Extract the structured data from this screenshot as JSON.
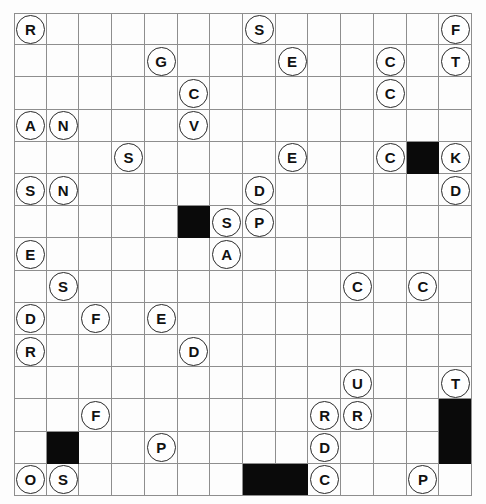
{
  "puzzle": {
    "title": "Letter Circle Grid Puzzle",
    "type": "grid-puzzle",
    "grid": {
      "columns": 14,
      "rows": 15,
      "cell_size": 32.7
    },
    "colors": {
      "grid_line": "#8e8e8e",
      "blocked_cell": "#0a0a0a",
      "token_fill": "#ffffff",
      "token_border": "#2a2a2a",
      "background": "#ffffff"
    },
    "blocked_cells": [
      {
        "col": 12,
        "row": 4
      },
      {
        "col": 5,
        "row": 6
      },
      {
        "col": 13,
        "row": 12
      },
      {
        "col": 13,
        "row": 13
      },
      {
        "col": 1,
        "row": 13
      },
      {
        "col": 7,
        "row": 14
      },
      {
        "col": 8,
        "row": 14
      }
    ],
    "tokens": [
      {
        "col": 0,
        "row": 0,
        "letter": "R"
      },
      {
        "col": 7,
        "row": 0,
        "letter": "S"
      },
      {
        "col": 13,
        "row": 0,
        "letter": "F"
      },
      {
        "col": 4,
        "row": 1,
        "letter": "G"
      },
      {
        "col": 8,
        "row": 1,
        "letter": "E"
      },
      {
        "col": 11,
        "row": 1,
        "letter": "C"
      },
      {
        "col": 13,
        "row": 1,
        "letter": "T"
      },
      {
        "col": 5,
        "row": 2,
        "letter": "C"
      },
      {
        "col": 11,
        "row": 2,
        "letter": "C"
      },
      {
        "col": 0,
        "row": 3,
        "letter": "A"
      },
      {
        "col": 1,
        "row": 3,
        "letter": "N"
      },
      {
        "col": 5,
        "row": 3,
        "letter": "V"
      },
      {
        "col": 3,
        "row": 4,
        "letter": "S"
      },
      {
        "col": 8,
        "row": 4,
        "letter": "E"
      },
      {
        "col": 11,
        "row": 4,
        "letter": "C"
      },
      {
        "col": 13,
        "row": 4,
        "letter": "K"
      },
      {
        "col": 0,
        "row": 5,
        "letter": "S"
      },
      {
        "col": 1,
        "row": 5,
        "letter": "N"
      },
      {
        "col": 7,
        "row": 5,
        "letter": "D"
      },
      {
        "col": 13,
        "row": 5,
        "letter": "D"
      },
      {
        "col": 6,
        "row": 6,
        "letter": "S"
      },
      {
        "col": 7,
        "row": 6,
        "letter": "P"
      },
      {
        "col": 0,
        "row": 7,
        "letter": "E"
      },
      {
        "col": 6,
        "row": 7,
        "letter": "A"
      },
      {
        "col": 1,
        "row": 8,
        "letter": "S"
      },
      {
        "col": 10,
        "row": 8,
        "letter": "C"
      },
      {
        "col": 12,
        "row": 8,
        "letter": "C"
      },
      {
        "col": 0,
        "row": 9,
        "letter": "D"
      },
      {
        "col": 2,
        "row": 9,
        "letter": "F"
      },
      {
        "col": 4,
        "row": 9,
        "letter": "E"
      },
      {
        "col": 0,
        "row": 10,
        "letter": "R"
      },
      {
        "col": 5,
        "row": 10,
        "letter": "D"
      },
      {
        "col": 10,
        "row": 11,
        "letter": "U"
      },
      {
        "col": 13,
        "row": 11,
        "letter": "T"
      },
      {
        "col": 2,
        "row": 12,
        "letter": "F"
      },
      {
        "col": 9,
        "row": 12,
        "letter": "R"
      },
      {
        "col": 10,
        "row": 12,
        "letter": "R"
      },
      {
        "col": 4,
        "row": 13,
        "letter": "P"
      },
      {
        "col": 9,
        "row": 13,
        "letter": "D"
      },
      {
        "col": 0,
        "row": 14,
        "letter": "O"
      },
      {
        "col": 1,
        "row": 14,
        "letter": "S"
      },
      {
        "col": 9,
        "row": 14,
        "letter": "C"
      },
      {
        "col": 12,
        "row": 14,
        "letter": "P"
      }
    ]
  }
}
